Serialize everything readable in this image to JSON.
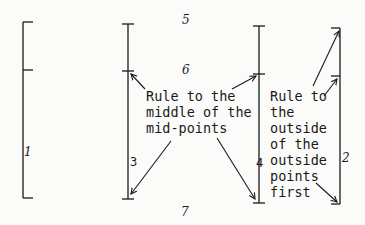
{
  "diagram": {
    "type": "rule-bracket-illustration",
    "colors": {
      "ink": "#1a1a1a",
      "background": "#fbfbfa"
    },
    "labels": {
      "bracket_1": "1",
      "bracket_2": "2",
      "line_3": "3",
      "line_4": "4",
      "gap_5": "5",
      "gap_6": "6",
      "gap_7": "7"
    },
    "notes": {
      "middle": [
        "Rule to the",
        "middle of the",
        "mid-points"
      ],
      "outside": [
        "Rule to",
        "the",
        "outside",
        "of the",
        "outside",
        "points",
        "first"
      ]
    }
  }
}
